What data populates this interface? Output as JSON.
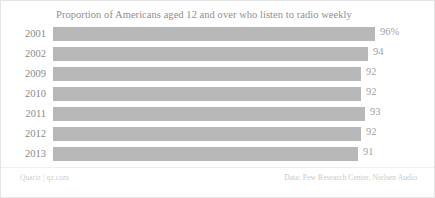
{
  "chart_data": {
    "type": "bar",
    "orientation": "horizontal",
    "title": "Proportion of Americans aged 12 and over who listen to radio weekly",
    "xlabel": "",
    "ylabel": "",
    "grid": false,
    "legend": null,
    "categories": [
      "2001",
      "2002",
      "2009",
      "2010",
      "2011",
      "2012",
      "2013"
    ],
    "values": [
      96,
      94,
      92,
      92,
      93,
      92,
      91
    ],
    "value_labels": [
      "96%",
      "94",
      "92",
      "92",
      "93",
      "92",
      "91"
    ],
    "xlim": [
      0,
      100
    ],
    "bar_color": "#b8b8b8",
    "points": [
      {
        "category": "2001",
        "value": 96,
        "label": "96%"
      },
      {
        "category": "2002",
        "value": 94,
        "label": "94"
      },
      {
        "category": "2009",
        "value": 92,
        "label": "92"
      },
      {
        "category": "2010",
        "value": 92,
        "label": "92"
      },
      {
        "category": "2011",
        "value": 93,
        "label": "93"
      },
      {
        "category": "2012",
        "value": 92,
        "label": "92"
      },
      {
        "category": "2013",
        "value": 91,
        "label": "91"
      }
    ]
  },
  "footer": {
    "credit": "Quartz | qz.com",
    "source": "Data: Pew Research Center, Nielsen Audio"
  },
  "colors": {
    "bar": "#b8b8b8",
    "title_text": "#8f8f8f",
    "label_text": "#8a8a8a",
    "value_text": "#a3a3a3",
    "footer_text": "#cfcfcf",
    "border": "#e4e4e4",
    "background": "#ffffff"
  }
}
